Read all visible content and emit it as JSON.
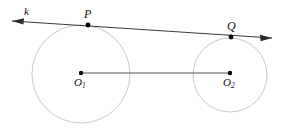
{
  "figure": {
    "type": "geometry-diagram",
    "background_color": "#ffffff",
    "canvas": {
      "width": 282,
      "height": 131
    }
  },
  "labels": {
    "line_k": "k",
    "point_p": "P",
    "point_q": "Q",
    "center_1": "O",
    "center_1_sub": "1",
    "center_2": "O",
    "center_2_sub": "2"
  },
  "geometry": {
    "line_k": {
      "name": "k",
      "x1": 12,
      "y1": 21,
      "x2": 272,
      "y2": 38,
      "stroke": "#3a3a3a",
      "stroke_width": 1,
      "arrow_start": true,
      "arrow_end": true
    },
    "circles": [
      {
        "name": "circle-1",
        "cx": 81,
        "cy": 74,
        "r": 49,
        "stroke": "#c9c9c9",
        "stroke_width": 1,
        "fill": "none"
      },
      {
        "name": "circle-2",
        "cx": 230,
        "cy": 75,
        "r": 37,
        "stroke": "#c9c9c9",
        "stroke_width": 1,
        "fill": "none"
      }
    ],
    "center_segment": {
      "name": "O1O2",
      "x1": 81,
      "y1": 73,
      "x2": 230,
      "y2": 73,
      "stroke": "#555555",
      "stroke_width": 1
    },
    "points": [
      {
        "name": "P",
        "x": 88,
        "y": 25,
        "r": 2.4,
        "fill": "#000000"
      },
      {
        "name": "Q",
        "x": 231,
        "y": 37,
        "r": 2.4,
        "fill": "#000000"
      },
      {
        "name": "O1",
        "x": 81,
        "y": 73,
        "r": 2.2,
        "fill": "#000000"
      },
      {
        "name": "O2",
        "x": 230,
        "y": 73,
        "r": 2.2,
        "fill": "#000000"
      }
    ]
  },
  "colors": {
    "line": "#3a3a3a",
    "circle": "#c9c9c9",
    "segment": "#555555",
    "point": "#000000",
    "text": "#111111",
    "background": "#ffffff"
  }
}
